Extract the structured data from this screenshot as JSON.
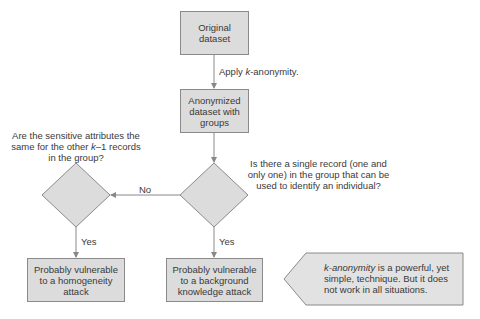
{
  "nodes": {
    "original": {
      "label_line1": "Original",
      "label_line2": "dataset"
    },
    "anonymized": {
      "label_line1": "Anonymized",
      "label_line2": "dataset with",
      "label_line3": "groups"
    },
    "homogeneity": {
      "line1": "Probably vulnerable",
      "line2": "to a homogeneity",
      "line3": "attack"
    },
    "background": {
      "line1": "Probably vulnerable",
      "line2": "to a background",
      "line3": "knowledge attack"
    }
  },
  "edges": {
    "apply_prefix": "Apply ",
    "apply_k": "k",
    "apply_suffix": "-anonymity.",
    "no": "No",
    "yes_left": "Yes",
    "yes_right": "Yes"
  },
  "questions": {
    "sensitive_line1": "Are the sensitive attributes the",
    "sensitive_line2_prefix": "same for the other ",
    "sensitive_line2_k": "k",
    "sensitive_line2_suffix": "–1 records",
    "sensitive_line3": "in the group?",
    "single_line1": "Is there a single record (one and",
    "single_line2": "only one) in the group that can be",
    "single_line3": "used to identify an individual?"
  },
  "callout": {
    "italic": "k-anonymity",
    "line1_rest": " is a powerful, yet",
    "line2": "simple, technique. But it does",
    "line3": "not work in all situations."
  },
  "colors": {
    "fill": "#dcdcdc",
    "stroke": "#8a8a8a",
    "arrow": "#888888"
  }
}
